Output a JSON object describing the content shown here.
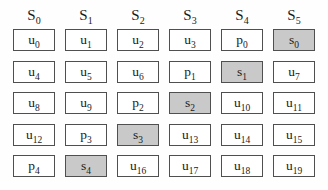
{
  "colors": {
    "border": "#4f4f4f",
    "shaded": "#c9c9c9",
    "background": "#fefefe",
    "text": "#1a1a1a"
  },
  "headers": [
    {
      "label": "S",
      "sub": "0"
    },
    {
      "label": "S",
      "sub": "1"
    },
    {
      "label": "S",
      "sub": "2"
    },
    {
      "label": "S",
      "sub": "3"
    },
    {
      "label": "S",
      "sub": "4"
    },
    {
      "label": "S",
      "sub": "5"
    }
  ],
  "grid": [
    [
      {
        "label": "u",
        "sub": "0",
        "shaded": false
      },
      {
        "label": "u",
        "sub": "1",
        "shaded": false
      },
      {
        "label": "u",
        "sub": "2",
        "shaded": false
      },
      {
        "label": "u",
        "sub": "3",
        "shaded": false
      },
      {
        "label": "p",
        "sub": "0",
        "shaded": false
      },
      {
        "label": "s",
        "sub": "0",
        "shaded": true
      }
    ],
    [
      {
        "label": "u",
        "sub": "4",
        "shaded": false
      },
      {
        "label": "u",
        "sub": "5",
        "shaded": false
      },
      {
        "label": "u",
        "sub": "6",
        "shaded": false
      },
      {
        "label": "p",
        "sub": "1",
        "shaded": false
      },
      {
        "label": "s",
        "sub": "1",
        "shaded": true
      },
      {
        "label": "u",
        "sub": "7",
        "shaded": false
      }
    ],
    [
      {
        "label": "u",
        "sub": "8",
        "shaded": false
      },
      {
        "label": "u",
        "sub": "9",
        "shaded": false
      },
      {
        "label": "p",
        "sub": "2",
        "shaded": false
      },
      {
        "label": "s",
        "sub": "2",
        "shaded": true
      },
      {
        "label": "u",
        "sub": "10",
        "shaded": false
      },
      {
        "label": "u",
        "sub": "11",
        "shaded": false
      }
    ],
    [
      {
        "label": "u",
        "sub": "12",
        "shaded": false
      },
      {
        "label": "p",
        "sub": "3",
        "shaded": false
      },
      {
        "label": "s",
        "sub": "3",
        "shaded": true
      },
      {
        "label": "u",
        "sub": "13",
        "shaded": false
      },
      {
        "label": "u",
        "sub": "14",
        "shaded": false
      },
      {
        "label": "u",
        "sub": "15",
        "shaded": false
      }
    ],
    [
      {
        "label": "p",
        "sub": "4",
        "shaded": false
      },
      {
        "label": "s",
        "sub": "4",
        "shaded": true
      },
      {
        "label": "u",
        "sub": "16",
        "shaded": false
      },
      {
        "label": "u",
        "sub": "17",
        "shaded": false
      },
      {
        "label": "u",
        "sub": "18",
        "shaded": false
      },
      {
        "label": "u",
        "sub": "19",
        "shaded": false
      }
    ]
  ]
}
